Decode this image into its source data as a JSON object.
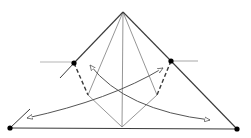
{
  "diagram": {
    "type": "geometric-sketch",
    "colors": {
      "background": "#ffffff",
      "stroke": "#3a3a3a",
      "light_stroke": "#8a8a8a",
      "guide": "#b5b5b5",
      "dot": "#000000",
      "arrow": "#555555"
    },
    "points": {
      "apex": [
        123,
        12
      ],
      "left_mid": [
        74,
        63
      ],
      "right_mid": [
        171,
        61
      ],
      "bottom_left": [
        10,
        128
      ],
      "bottom_right": [
        237,
        129
      ],
      "inner_left": [
        88,
        95
      ],
      "inner_right": [
        157,
        95
      ],
      "bottom_center": [
        122,
        127
      ]
    },
    "dots": [
      "left_mid",
      "right_mid",
      "bottom_left",
      "bottom_right"
    ],
    "solid_edges": [
      [
        "apex",
        "left_mid"
      ],
      [
        "apex",
        "right_mid"
      ],
      [
        "right_mid",
        "bottom_right"
      ],
      [
        "bottom_left",
        "bottom_right"
      ]
    ],
    "inner_edges": [
      [
        "apex",
        "inner_left"
      ],
      [
        "apex",
        "inner_right"
      ],
      [
        "apex",
        "bottom_center"
      ],
      [
        "inner_left",
        "bottom_center"
      ],
      [
        "inner_right",
        "bottom_center"
      ]
    ],
    "dashed_edges": [
      [
        "left_mid",
        "inner_left"
      ],
      [
        "right_mid",
        "inner_right"
      ]
    ],
    "guide_lines": [
      {
        "from": [
          0,
          62
        ],
        "to": [
          22,
          62
        ],
        "faded": true
      },
      {
        "from": [
          40,
          62
        ],
        "to": [
          74,
          62
        ],
        "faded": false
      },
      {
        "from": [
          171,
          61
        ],
        "to": [
          198,
          61
        ],
        "faded": false
      }
    ],
    "ticks": [
      {
        "from": [
          60,
          78
        ],
        "to": [
          74,
          63
        ]
      },
      {
        "from": [
          10,
          128
        ],
        "to": [
          30,
          109
        ]
      }
    ],
    "arrows": [
      {
        "name": "arrow-left-sweep",
        "path": "M163,68 Q110,100 27,118",
        "head_at": "end",
        "tail_head": true
      },
      {
        "name": "arrow-right-sweep",
        "path": "M90,65 Q125,110 210,120",
        "head_at": "end",
        "tail_head": true
      }
    ]
  }
}
